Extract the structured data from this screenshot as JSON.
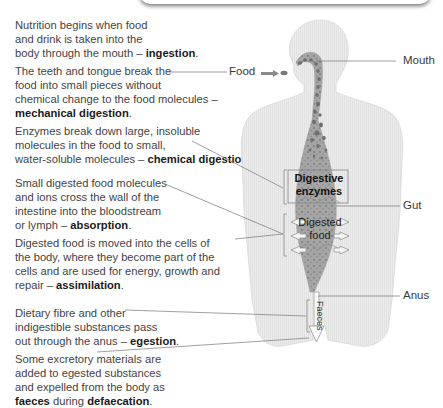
{
  "descriptions": [
    {
      "lines": [
        "Nutrition begins when food",
        "and drink is taken into the",
        "body through the mouth – "
      ],
      "term": "ingestion",
      "suffix": "."
    },
    {
      "lines": [
        "The teeth and tongue break the",
        "food into small pieces without",
        "chemical change to the food molecules –"
      ],
      "term": "mechanical digestion",
      "suffix": "."
    },
    {
      "lines": [
        "Enzymes break down large, insoluble",
        "molecules in the food to small,",
        "water-soluble molecules – "
      ],
      "term": "chemical digestion",
      "suffix": "."
    },
    {
      "lines": [
        "Small digested food molecules",
        "and ions cross the wall of the",
        "intestine into the bloodstream",
        "or lymph – "
      ],
      "term": "absorption",
      "suffix": "."
    },
    {
      "lines": [
        "Digested food is moved into the cells of",
        "the body, where they become part of the",
        "cells and are used for energy, growth and",
        "repair – "
      ],
      "term": "assimilation",
      "suffix": "."
    },
    {
      "lines": [
        "Dietary fibre and other",
        "indigestible substances pass",
        "out through the anus – "
      ],
      "term": "egestion",
      "suffix": "."
    },
    {
      "lines": [
        "Some excretory materials are",
        "added to egested substances",
        "and expelled from the body as"
      ],
      "term": "faeces",
      "middle": " during ",
      "term2": "defaecation",
      "suffix": "."
    }
  ],
  "labels": {
    "food": "Food",
    "mouth": "Mouth",
    "gut": "Gut",
    "anus": "Anus",
    "digestive_enzymes_1": "Digestive",
    "digestive_enzymes_2": "enzymes",
    "digested_food_1": "Digested",
    "digested_food_2": "food",
    "faeces": "Faeces"
  },
  "colors": {
    "body": "#e9e9e9",
    "gut": "#9a9a9a",
    "particles": "#6e6e6e",
    "leader_lines": "#777777"
  }
}
